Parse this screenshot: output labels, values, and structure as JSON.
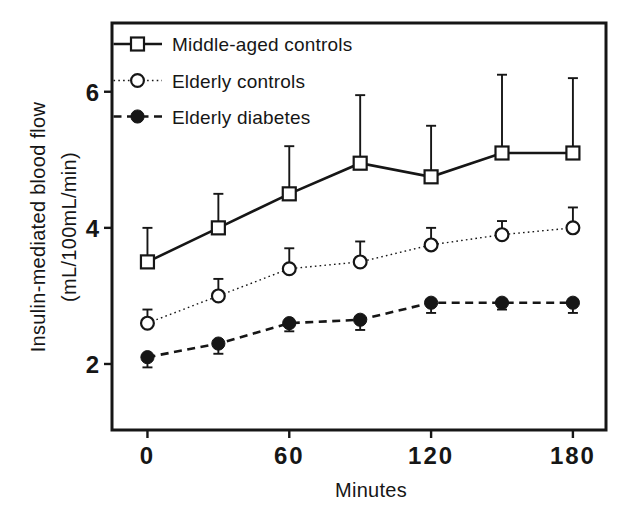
{
  "figure": {
    "background": "#ffffff",
    "ink_color": "#161616",
    "marker_fill": "#ffffff"
  },
  "chart_data": {
    "type": "line",
    "title": "",
    "xlabel": "Minutes",
    "ylabel": "Insulin-mediated blood flow",
    "ylabel_units": "(mL/100mL/min)",
    "x": [
      0,
      30,
      60,
      90,
      120,
      150,
      180
    ],
    "x_ticks": [
      0,
      60,
      120,
      180
    ],
    "x_tick_labels": [
      "0",
      "60",
      "120",
      "180"
    ],
    "y_ticks": [
      2,
      4,
      6
    ],
    "y_tick_labels": [
      "2",
      "4",
      "6"
    ],
    "xlim": [
      -15,
      194
    ],
    "ylim": [
      1.03,
      7.01
    ],
    "grid": false,
    "legend_position": "top-left",
    "series": [
      {
        "id": "middle-aged-controls",
        "name": "Middle-aged controls",
        "marker": "open-square",
        "line_style": "solid",
        "error_direction": "up",
        "values": [
          3.5,
          4.0,
          4.5,
          4.95,
          4.75,
          5.1,
          5.1
        ],
        "error": [
          0.5,
          0.5,
          0.7,
          1.0,
          0.75,
          1.15,
          1.1
        ]
      },
      {
        "id": "elderly-controls",
        "name": "Elderly controls",
        "marker": "open-circle",
        "line_style": "dotted",
        "error_direction": "up",
        "values": [
          2.6,
          3.0,
          3.4,
          3.5,
          3.75,
          3.9,
          4.0
        ],
        "error": [
          0.2,
          0.25,
          0.3,
          0.3,
          0.25,
          0.2,
          0.3
        ]
      },
      {
        "id": "elderly-diabetes",
        "name": "Elderly diabetes",
        "marker": "filled-circle",
        "line_style": "dashed",
        "error_direction": "down",
        "values": [
          2.1,
          2.3,
          2.6,
          2.65,
          2.9,
          2.9,
          2.9
        ],
        "error": [
          0.15,
          0.15,
          0.12,
          0.15,
          0.15,
          0.1,
          0.15
        ]
      }
    ]
  }
}
